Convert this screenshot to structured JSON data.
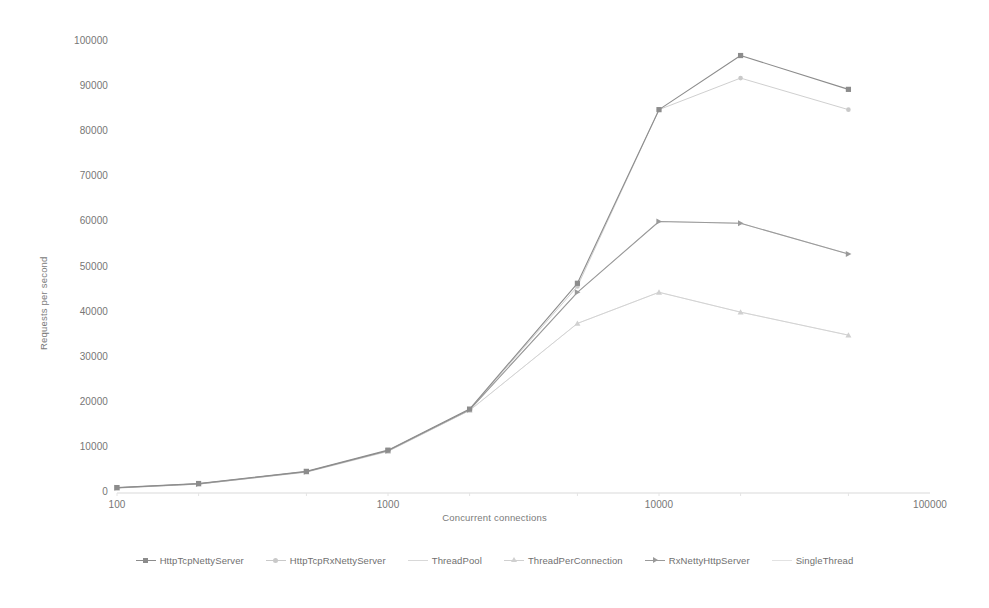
{
  "chart_data": {
    "type": "line",
    "title": "",
    "xlabel": "Concurrent connections",
    "ylabel": "Requests per second",
    "x_scale": "log",
    "x_ticks": [
      "100",
      "1000",
      "10000",
      "100000"
    ],
    "x_tick_values": [
      100,
      1000,
      10000,
      100000
    ],
    "xlim": [
      100,
      100000
    ],
    "y_ticks": [
      "0",
      "10000",
      "20000",
      "30000",
      "40000",
      "50000",
      "60000",
      "70000",
      "80000",
      "90000",
      "100000"
    ],
    "y_tick_values": [
      0,
      10000,
      20000,
      30000,
      40000,
      50000,
      60000,
      70000,
      80000,
      90000,
      100000
    ],
    "ylim": [
      0,
      100000
    ],
    "grid": false,
    "legend_position": "bottom",
    "x": [
      100,
      200,
      500,
      1000,
      2000,
      5000,
      10000,
      20000,
      50000
    ],
    "series": [
      {
        "name": "HttpTcpNettyServer",
        "marker": "square",
        "color": "#8c8c8c",
        "values": [
          1200,
          2100,
          4800,
          9500,
          18600,
          46500,
          85000,
          97000,
          89500
        ]
      },
      {
        "name": "HttpTcpRxNettyServer",
        "marker": "circle",
        "color": "#c9c9c9",
        "values": [
          1150,
          2050,
          4750,
          9400,
          18500,
          45800,
          85000,
          92000,
          85000
        ]
      },
      {
        "name": "ThreadPool",
        "marker": "none",
        "color": "#d8d8d8",
        "values": [
          1100,
          2000,
          4700,
          9300,
          18400,
          44500,
          60200,
          59800,
          53000
        ]
      },
      {
        "name": "ThreadPerConnection",
        "marker": "triangle",
        "color": "#d0d0d0",
        "values": [
          1100,
          1980,
          4650,
          9250,
          18300,
          37600,
          44500,
          40100,
          35000
        ]
      },
      {
        "name": "RxNettyHttpServer",
        "marker": "arrow",
        "color": "#9a9a9a",
        "values": [
          1150,
          2020,
          4700,
          9350,
          18450,
          44500,
          60200,
          59800,
          53000
        ]
      },
      {
        "name": "SingleThread",
        "marker": "none",
        "color": "#e2e2e2",
        "values": [
          1100,
          1960,
          4600,
          9200,
          18300,
          37600,
          44500,
          40100,
          35000
        ]
      }
    ]
  },
  "axis": {
    "x_title": "Concurrent connections",
    "y_title": "Requests per second"
  },
  "legend": {
    "items": [
      {
        "label": "HttpTcpNettyServer"
      },
      {
        "label": "HttpTcpRxNettyServer"
      },
      {
        "label": "ThreadPool"
      },
      {
        "label": "ThreadPerConnection"
      },
      {
        "label": "RxNettyHttpServer"
      },
      {
        "label": "SingleThread"
      }
    ]
  },
  "colors": {
    "background": "#ffffff",
    "text": "#767676",
    "axis_line": "#d9d9d9"
  }
}
